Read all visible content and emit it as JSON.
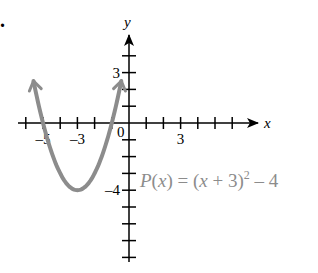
{
  "chart_data": {
    "type": "line",
    "title": "",
    "xlabel": "x",
    "ylabel": "y",
    "function_label": "P(x) = (x + 3)² – 4",
    "function_label_parts": {
      "pre": "P(x) = (x + 3)",
      "sup": "2",
      "post": " – 4"
    },
    "x_tick_labels": [
      {
        "value": -5,
        "text": "–5"
      },
      {
        "value": -3,
        "text": "–3"
      },
      {
        "value": 3,
        "text": "3"
      }
    ],
    "y_tick_labels": [
      {
        "value": 3,
        "text": "3"
      },
      {
        "value": -4,
        "text": "–4"
      }
    ],
    "origin_label": "0",
    "xlim": [
      -6,
      7.5
    ],
    "ylim": [
      -8,
      5.3
    ],
    "x_ticks": [
      -6,
      -5,
      -4,
      -3,
      -2,
      -1,
      1,
      2,
      3,
      4,
      5,
      6
    ],
    "y_ticks": [
      4,
      3,
      2,
      1,
      -1,
      -2,
      -3,
      -4,
      -5,
      -6,
      -7,
      -8
    ],
    "grid": false,
    "series": [
      {
        "name": "P(x)",
        "color": "#8c8c8c",
        "x": [
          -5.5,
          -5,
          -4,
          -3,
          -2,
          -1,
          -0.5
        ],
        "values": [
          2.25,
          0,
          -3,
          -4,
          -3,
          0,
          2.25
        ],
        "arrows_both_ends": true
      }
    ],
    "vertex": {
      "x": -3,
      "y": -4
    },
    "colors": {
      "axis": "#000000",
      "curve": "#8c8c8c",
      "label": "#8c8c8c"
    }
  },
  "marker": "."
}
